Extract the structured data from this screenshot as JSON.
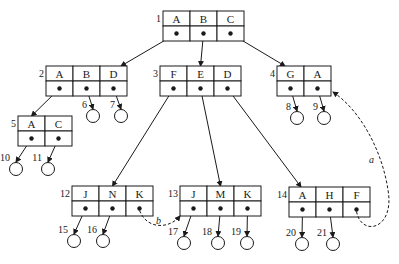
{
  "diagram": {
    "type": "b-tree",
    "nodes": [
      {
        "id": "1",
        "keys": [
          "A",
          "B",
          "C"
        ],
        "x": 163,
        "y": 11
      },
      {
        "id": "2",
        "keys": [
          "A",
          "B",
          "D"
        ],
        "x": 46,
        "y": 66
      },
      {
        "id": "3",
        "keys": [
          "F",
          "E",
          "D"
        ],
        "x": 160,
        "y": 66
      },
      {
        "id": "4",
        "keys": [
          "G",
          "A"
        ],
        "x": 277,
        "y": 66
      },
      {
        "id": "5",
        "keys": [
          "A",
          "C"
        ],
        "x": 18,
        "y": 116
      },
      {
        "id": "12",
        "keys": [
          "J",
          "N",
          "K"
        ],
        "x": 72,
        "y": 186
      },
      {
        "id": "13",
        "keys": [
          "J",
          "M",
          "K"
        ],
        "x": 180,
        "y": 186
      },
      {
        "id": "14",
        "keys": [
          "A",
          "H",
          "F"
        ],
        "x": 289,
        "y": 187
      }
    ],
    "leaves": [
      {
        "id": "6",
        "cx": 93,
        "cy": 116
      },
      {
        "id": "7",
        "cx": 121,
        "cy": 116
      },
      {
        "id": "8",
        "cx": 297,
        "cy": 118
      },
      {
        "id": "9",
        "cx": 324,
        "cy": 118
      },
      {
        "id": "10",
        "cx": 16,
        "cy": 169
      },
      {
        "id": "11",
        "cx": 48,
        "cy": 169
      },
      {
        "id": "15",
        "cx": 74,
        "cy": 241
      },
      {
        "id": "16",
        "cx": 103,
        "cy": 241
      },
      {
        "id": "17",
        "cx": 184,
        "cy": 243
      },
      {
        "id": "18",
        "cx": 218,
        "cy": 243
      },
      {
        "id": "19",
        "cx": 247,
        "cy": 243
      },
      {
        "id": "20",
        "cx": 302,
        "cy": 244
      },
      {
        "id": "21",
        "cx": 333,
        "cy": 244
      }
    ],
    "dashed_links": [
      {
        "label": "a",
        "from": "14.F",
        "to": "4"
      },
      {
        "label": "b",
        "from": "12.K",
        "to": "13"
      }
    ]
  }
}
